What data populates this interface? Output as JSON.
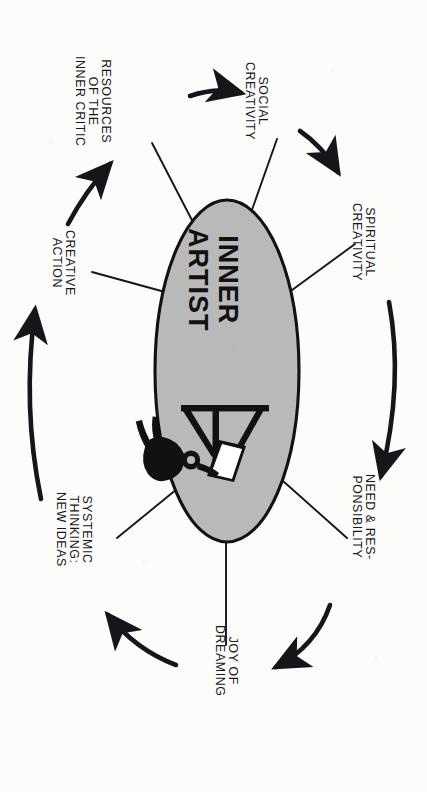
{
  "diagram": {
    "orientation": "rotated-90-clockwise",
    "center": {
      "label_line1": "INNER",
      "label_line2": "ARTIST",
      "shape": "ellipse",
      "fill_color": "#b9b9b9",
      "stroke_color": "#111111",
      "illustration": "artist-at-easel-icon"
    },
    "colors": {
      "ink": "#16161a",
      "oval_fill": "#b9b9b9",
      "page": "#fcfcfb"
    },
    "nodes": [
      {
        "id": "resources-of-the-inner-critic",
        "lines": [
          "RESOURCES",
          "OF THE",
          "INNER CRITIC"
        ]
      },
      {
        "id": "social-creativity",
        "lines": [
          "SOCIAL",
          "CREATIVITY"
        ]
      },
      {
        "id": "spiritual-creativity",
        "lines": [
          "SPIRITUAL",
          "CREATIVITY"
        ]
      },
      {
        "id": "need-and-responsibility",
        "lines": [
          "NEED & RES-",
          "PONSIBILITY"
        ]
      },
      {
        "id": "joy-of-dreaming",
        "lines": [
          "JOY OF",
          "DREAMING"
        ]
      },
      {
        "id": "systemic-thinking-new-ideas",
        "lines": [
          "SYSTEMIC",
          "THINKING:",
          "NEW IDEAS"
        ]
      },
      {
        "id": "creative-action",
        "lines": [
          "CREATIVE",
          "ACTION"
        ]
      }
    ],
    "arrows": [
      {
        "id": "arrow-resources-to-social",
        "from": "resources-of-the-inner-critic",
        "to": "social-creativity"
      },
      {
        "id": "arrow-social-to-spiritual",
        "from": "social-creativity",
        "to": "spiritual-creativity"
      },
      {
        "id": "arrow-spiritual-to-need",
        "from": "spiritual-creativity",
        "to": "need-and-responsibility"
      },
      {
        "id": "arrow-need-to-joy",
        "from": "need-and-responsibility",
        "to": "joy-of-dreaming"
      },
      {
        "id": "arrow-joy-to-systemic",
        "from": "joy-of-dreaming",
        "to": "systemic-thinking-new-ideas"
      },
      {
        "id": "arrow-systemic-to-creative-action",
        "from": "systemic-thinking-new-ideas",
        "to": "creative-action"
      },
      {
        "id": "arrow-creative-action-to-resources",
        "from": "creative-action",
        "to": "resources-of-the-inner-critic"
      }
    ]
  }
}
